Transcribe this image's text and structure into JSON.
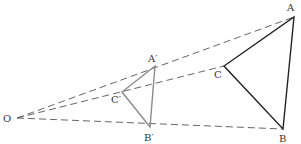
{
  "diagram": {
    "title": "",
    "points": {
      "O": {
        "label": "O",
        "x": 17,
        "y": 118
      },
      "A": {
        "label": "A",
        "x": 294,
        "y": 17
      },
      "B": {
        "label": "B",
        "x": 283,
        "y": 129
      },
      "C": {
        "label": "C",
        "x": 224,
        "y": 66
      },
      "A1": {
        "label": "A′",
        "x": 155,
        "y": 66
      },
      "B1": {
        "label": "B′",
        "x": 150,
        "y": 127
      },
      "C1": {
        "label": "C′",
        "x": 122,
        "y": 92
      }
    },
    "colors": {
      "original_triangle": "#222222",
      "image_triangle": "#8a8a8a",
      "dashed_rays": "#555555"
    }
  }
}
